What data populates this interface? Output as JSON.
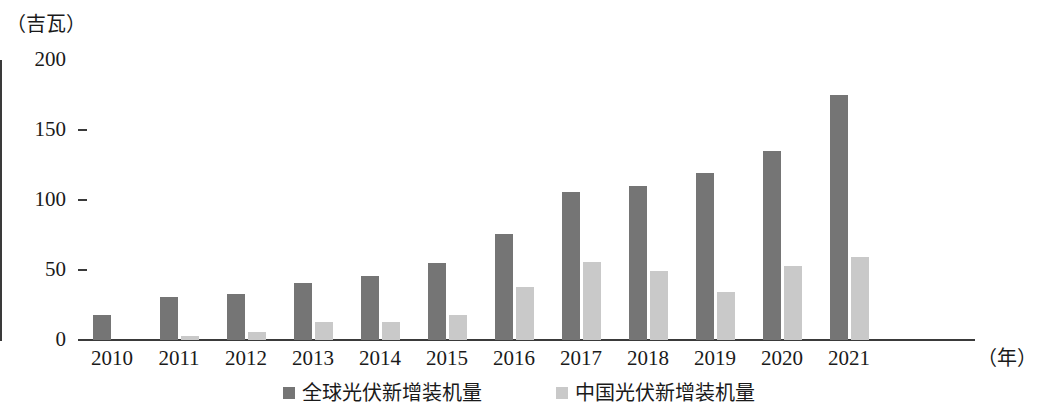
{
  "chart_data": {
    "type": "bar",
    "title": "",
    "subtitle": "",
    "ylabel": "（吉瓦）",
    "xlabel": "（年）",
    "ylim": [
      0,
      200
    ],
    "yticks": [
      0,
      50,
      100,
      150,
      200
    ],
    "grid": false,
    "legend_position": "bottom",
    "categories": [
      "2010",
      "2011",
      "2012",
      "2013",
      "2014",
      "2015",
      "2016",
      "2017",
      "2018",
      "2019",
      "2020",
      "2021"
    ],
    "series": [
      {
        "name": "全球光伏新增装机量",
        "color": "#757575",
        "values": [
          18,
          31,
          33,
          41,
          46,
          55,
          76,
          106,
          110,
          119,
          135,
          175
        ]
      },
      {
        "name": "中国光伏新增装机量",
        "color": "#c9c9c9",
        "values": [
          0,
          3,
          6,
          13,
          13,
          18,
          38,
          56,
          49,
          34,
          53,
          59
        ]
      }
    ]
  },
  "axes": {
    "y_unit_caption": "（吉瓦）",
    "x_unit_caption": "（年）",
    "y_tick_labels": [
      "200",
      "150",
      "100",
      "50",
      "0"
    ]
  },
  "legend": {
    "items": [
      {
        "label": "全球光伏新增装机量",
        "color": "#757575"
      },
      {
        "label": "中国光伏新增装机量",
        "color": "#c9c9c9"
      }
    ]
  }
}
